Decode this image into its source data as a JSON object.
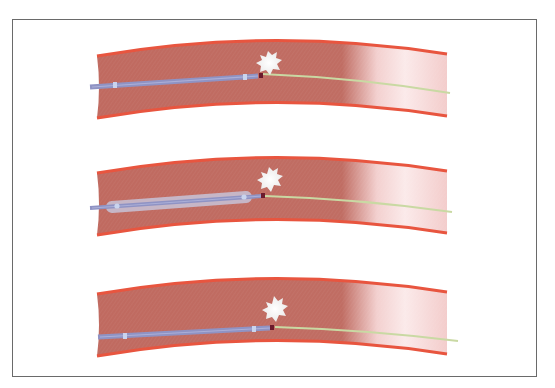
{
  "figure": {
    "type": "medical-illustration",
    "colors": {
      "vessel_wall": "#e8553f",
      "vessel_lumen": "#c06a60",
      "vessel_clear": "#f7d8d8",
      "catheter": "#8f93c4",
      "catheter_marker": "#c9d4ee",
      "balloon": "#c7c3d8",
      "guidewire": "#c9d9a3",
      "tip": "#6b1a2c",
      "clot": "#f4f1f0",
      "frame": "#6a6a6a"
    },
    "panels": [
      {
        "id": 1,
        "stage": "catheter-approach",
        "balloon": false
      },
      {
        "id": 2,
        "stage": "balloon-inflated",
        "balloon": true
      },
      {
        "id": 3,
        "stage": "catheter-advanced",
        "balloon": false
      }
    ]
  }
}
